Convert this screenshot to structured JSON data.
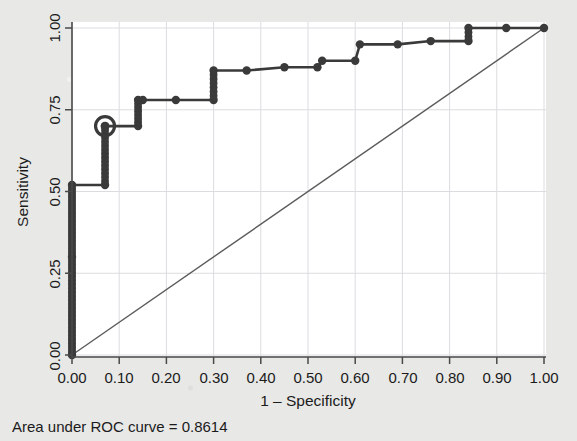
{
  "chart_data": {
    "type": "line",
    "title": "",
    "xlabel": "1 – Specificity",
    "ylabel": "Sensitivity",
    "xlim": [
      0,
      1
    ],
    "ylim": [
      0,
      1
    ],
    "xticks": [
      "0.00",
      "0.10",
      "0.20",
      "0.30",
      "0.40",
      "0.50",
      "0.60",
      "0.70",
      "0.80",
      "0.90",
      "1.00"
    ],
    "xtick_values": [
      0,
      0.1,
      0.2,
      0.3,
      0.4,
      0.5,
      0.6,
      0.7,
      0.8,
      0.9,
      1.0
    ],
    "yticks": [
      "0.00",
      "0.25",
      "0.50",
      "0.75",
      "1.00"
    ],
    "ytick_values": [
      0,
      0.25,
      0.5,
      0.75,
      1.0
    ],
    "grid": true,
    "legend": "none",
    "annotation": "Area under ROC curve = 0.8614",
    "auc": 0.8614,
    "series": [
      {
        "name": "ROC curve",
        "style": "step",
        "color": "#3a3a3a",
        "marker": "filled-circle",
        "x": [
          0.0,
          0.0,
          0.0,
          0.07,
          0.07,
          0.14,
          0.14,
          0.15,
          0.22,
          0.3,
          0.3,
          0.37,
          0.45,
          0.52,
          0.53,
          0.6,
          0.61,
          0.69,
          0.76,
          0.84,
          0.84,
          0.92,
          1.0
        ],
        "y": [
          0.0,
          0.3,
          0.52,
          0.52,
          0.7,
          0.7,
          0.78,
          0.78,
          0.78,
          0.78,
          0.87,
          0.87,
          0.88,
          0.88,
          0.9,
          0.9,
          0.95,
          0.95,
          0.96,
          0.96,
          1.0,
          1.0,
          1.0
        ]
      },
      {
        "name": "Reference line",
        "style": "diagonal",
        "color": "#5b5b5b",
        "marker": "none",
        "x": [
          0,
          1
        ],
        "y": [
          0,
          1
        ]
      }
    ],
    "dense_marker_column": {
      "x": 0.0,
      "y_from": 0.0,
      "y_to": 0.52,
      "note": "dense stack of overlapping point markers"
    },
    "highlighted_point": {
      "x": 0.07,
      "y": 0.7,
      "marker": "circled-cutpoint"
    }
  },
  "labels": {
    "y_axis_title": "Sensitivity",
    "x_axis_title": "1 – Specificity",
    "caption": "Area under ROC curve = 0.8614",
    "x0": "0.00",
    "x1": "0.10",
    "x2": "0.20",
    "x3": "0.30",
    "x4": "0.40",
    "x5": "0.50",
    "x6": "0.60",
    "x7": "0.70",
    "x8": "0.80",
    "x9": "0.90",
    "x10": "1.00",
    "y0": "0.00",
    "y1": "0.25",
    "y2": "0.50",
    "y3": "0.75",
    "y4": "1.00"
  },
  "colors": {
    "page_background": "#e8e8e6",
    "plot_background": "#ffffff",
    "curve": "#3a3a3a",
    "reference_line": "#5b5b5b",
    "grid": "#d9d9dc",
    "axis": "#4a4a4a",
    "text": "#1b1b1b"
  }
}
